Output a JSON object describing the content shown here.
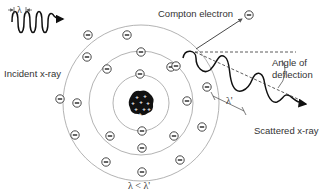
{
  "diagram": {
    "labels": {
      "incident": "Incident x-ray",
      "compton_electron": "Compton electron",
      "angle": [
        "Angle of",
        "deflection"
      ],
      "scattered": "Scattered x-ray",
      "lambda": "λ",
      "lambda_prime": "λ'",
      "relation": "λ < λ'"
    },
    "nucleus": {
      "cx": 141,
      "cy": 103,
      "r": 12,
      "charge_symbol": "+",
      "protons": 9
    },
    "orbits": [
      {
        "name": "inner",
        "r": 28
      },
      {
        "name": "middle",
        "r": 52
      },
      {
        "name": "outer",
        "r": 78
      }
    ],
    "electrons": [
      {
        "x": 140,
        "y": 74
      },
      {
        "x": 142,
        "y": 131
      },
      {
        "x": 107,
        "y": 69
      },
      {
        "x": 77,
        "y": 103
      },
      {
        "x": 110,
        "y": 136
      },
      {
        "x": 142,
        "y": 148
      },
      {
        "x": 174,
        "y": 136
      },
      {
        "x": 187,
        "y": 101
      },
      {
        "x": 171,
        "y": 67
      },
      {
        "x": 141,
        "y": 52
      },
      {
        "x": 88,
        "y": 35
      },
      {
        "x": 127,
        "y": 35
      },
      {
        "x": 60,
        "y": 99
      },
      {
        "x": 75,
        "y": 135
      },
      {
        "x": 106,
        "y": 162
      },
      {
        "x": 142,
        "y": 172
      },
      {
        "x": 180,
        "y": 160
      },
      {
        "x": 202,
        "y": 127
      },
      {
        "x": 207,
        "y": 87
      },
      {
        "x": 176,
        "y": 66
      },
      {
        "x": 87,
        "y": 57
      },
      {
        "x": 249,
        "y": 15
      }
    ],
    "electron_symbol": "−",
    "colors": {
      "line": "#111111",
      "orbit": "#9a9a9a",
      "text": "#333333",
      "nucleus": "#111111"
    }
  }
}
